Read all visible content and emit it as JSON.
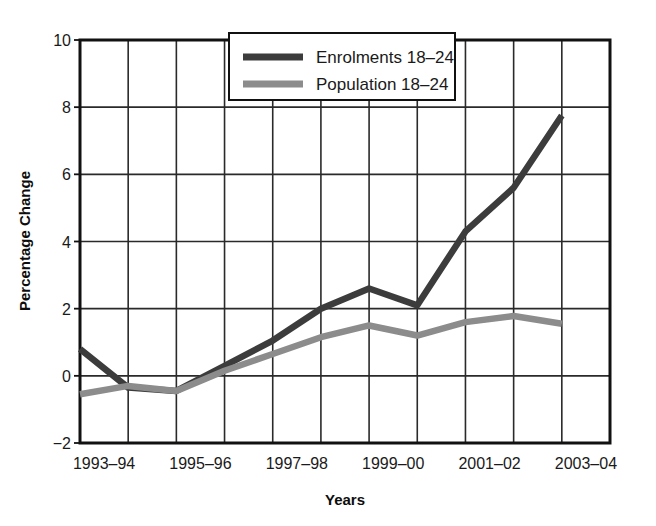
{
  "chart_data": {
    "type": "line",
    "title": "",
    "xlabel": "Years",
    "ylabel": "Percentage Change",
    "ylim": [
      -2,
      10
    ],
    "yticks": [
      -2,
      0,
      2,
      4,
      6,
      8,
      10
    ],
    "ytick_labels": [
      "−2",
      "0",
      "2",
      "4",
      "6",
      "8",
      "10"
    ],
    "grid": true,
    "legend_position": "top-center",
    "x": [
      "1993–94",
      "1994–95",
      "1995–96",
      "1996–97",
      "1997–98",
      "1998–99",
      "1999–00",
      "2000–01",
      "2001–02",
      "2002–03",
      "2003–04",
      "2004–05"
    ],
    "xtick_labels": [
      "1993–94",
      "1995–96",
      "1997–98",
      "1999–00",
      "2001–02",
      "2003–04"
    ],
    "xtick_indices": [
      0,
      2,
      4,
      6,
      8,
      10
    ],
    "series": [
      {
        "name": "Enrolments 18–24",
        "color": "#3c3c3c",
        "values": [
          0.8,
          -0.35,
          -0.45,
          0.3,
          1.05,
          2.0,
          2.6,
          2.1,
          4.3,
          5.6,
          7.75,
          null
        ]
      },
      {
        "name": "Population 18–24",
        "color": "#8c8c8c",
        "values": [
          -0.55,
          -0.3,
          -0.45,
          0.15,
          0.65,
          1.15,
          1.5,
          1.2,
          1.6,
          1.78,
          1.55,
          null
        ]
      }
    ]
  },
  "axes": {
    "y_title": "Percentage Change",
    "x_title": "Years"
  },
  "legend": {
    "items": [
      {
        "label": "Enrolments 18–24",
        "color": "#3c3c3c"
      },
      {
        "label": "Population 18–24",
        "color": "#8c8c8c"
      }
    ]
  },
  "colors": {
    "axis": "#111111",
    "grid": "#2a2a2a",
    "background": "#ffffff",
    "enrolments": "#3c3c3c",
    "population": "#8c8c8c"
  }
}
